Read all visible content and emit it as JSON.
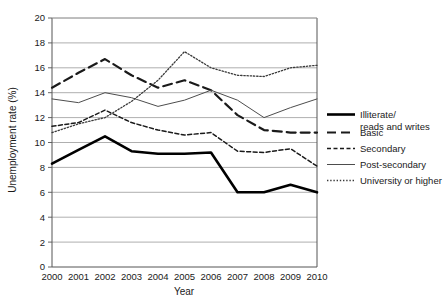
{
  "chart_data": {
    "type": "line",
    "title": "",
    "xlabel": "Year",
    "ylabel": "Unemployment rate (%)",
    "x": [
      2000,
      2001,
      2002,
      2003,
      2004,
      2005,
      2006,
      2007,
      2008,
      2009,
      2010
    ],
    "categories": [
      "2000",
      "2001",
      "2002",
      "2003",
      "2004",
      "2005",
      "2006",
      "2007",
      "2008",
      "2009",
      "2010"
    ],
    "ylim": [
      0,
      20
    ],
    "ytick_step": 2,
    "yticks": [
      "0",
      "2",
      "4",
      "6",
      "8",
      "10",
      "12",
      "14",
      "16",
      "18",
      "20"
    ],
    "xlim": [
      2000,
      2010
    ],
    "grid": "horizontal",
    "legend_position": "right",
    "series": [
      {
        "name": "Illiterate/\nreads and writes",
        "legend_label_line1": "Illiterate/",
        "legend_label_line2": "reads and writes",
        "style": "solid-thick",
        "color": "#000000",
        "values": [
          8.3,
          9.4,
          10.5,
          9.3,
          9.1,
          9.1,
          9.2,
          6.0,
          6.0,
          6.6,
          6.0
        ]
      },
      {
        "name": "Basic",
        "legend_label_line1": "Basic",
        "legend_label_line2": "",
        "style": "long-dash",
        "color": "#1a1a1a",
        "values": [
          14.4,
          15.6,
          16.7,
          15.4,
          14.4,
          15.0,
          14.2,
          12.2,
          11.0,
          10.8,
          10.8
        ]
      },
      {
        "name": "Secondary",
        "legend_label_line1": "Secondary",
        "legend_label_line2": "",
        "style": "short-dash",
        "color": "#1a1a1a",
        "values": [
          11.3,
          11.6,
          12.6,
          11.6,
          11.0,
          10.6,
          10.8,
          9.3,
          9.2,
          9.5,
          8.1
        ]
      },
      {
        "name": "Post-secondary",
        "legend_label_line1": "Post-secondary",
        "legend_label_line2": "",
        "style": "solid-thin",
        "color": "#4d4d4d",
        "values": [
          13.5,
          13.2,
          14.0,
          13.6,
          12.9,
          13.4,
          14.2,
          13.4,
          12.0,
          12.8,
          13.5
        ]
      },
      {
        "name": "University or higher",
        "legend_label_line1": "University or higher",
        "legend_label_line2": "",
        "style": "dotted",
        "color": "#3a3a3a",
        "values": [
          10.8,
          11.5,
          12.0,
          13.3,
          15.0,
          17.3,
          16.0,
          15.4,
          15.3,
          16.0,
          16.2
        ]
      }
    ]
  },
  "axes": {
    "y_title": "Unemployment rate (%)",
    "x_title": "Year",
    "y_ticks": [
      "20",
      "18",
      "16",
      "14",
      "12",
      "10",
      "8",
      "6",
      "4",
      "2",
      "0"
    ],
    "x_ticks": [
      "2000",
      "2001",
      "2002",
      "2003",
      "2004",
      "2005",
      "2006",
      "2007",
      "2008",
      "2009",
      "2010"
    ]
  },
  "legend": {
    "entries": [
      {
        "label1": "Illiterate/",
        "label2": "reads and writes",
        "swatch": "solid-thick-swatch"
      },
      {
        "label1": "Basic",
        "label2": "",
        "swatch": "long-dash-swatch"
      },
      {
        "label1": "Secondary",
        "label2": "",
        "swatch": "short-dash-swatch"
      },
      {
        "label1": "Post-secondary",
        "label2": "",
        "swatch": "solid-thin-swatch"
      },
      {
        "label1": "University or higher",
        "label2": "",
        "swatch": "dotted-swatch"
      }
    ]
  },
  "colors": {
    "plot_border": "#555555",
    "gridline": "#9a9a9a",
    "background": "#ffffff",
    "text": "#1a1a1a"
  }
}
